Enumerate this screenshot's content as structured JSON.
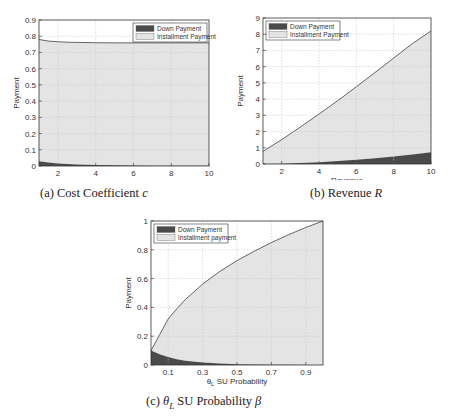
{
  "chart_data": [
    {
      "id": "a",
      "type": "area",
      "stacked": true,
      "title": "",
      "caption": "(a) Cost Coefficient c",
      "caption_parts": {
        "prefix": "(a) Cost Coefficient ",
        "var": "c"
      },
      "xlabel": "Cost Coefficient",
      "ylabel": "Payment",
      "xlim": [
        1,
        10
      ],
      "ylim": [
        0,
        0.9
      ],
      "xticks": [
        2,
        4,
        6,
        8,
        10
      ],
      "xtick_labels": [
        "2",
        "4",
        "6",
        "8",
        "10"
      ],
      "yticks": [
        0,
        0.1,
        0.2,
        0.3,
        0.4,
        0.5,
        0.6,
        0.7,
        0.8,
        0.9
      ],
      "ytick_labels": [
        "0",
        "0.1",
        "0.2",
        "0.3",
        "0.4",
        "0.5",
        "0.6",
        "0.7",
        "0.8",
        "0.9"
      ],
      "grid": true,
      "legend_position": "upper right",
      "x": [
        1,
        1.5,
        2,
        2.5,
        3,
        4,
        5,
        6,
        7,
        8,
        9,
        10
      ],
      "series": [
        {
          "name": "Down Payment",
          "values": [
            0.03,
            0.022,
            0.016,
            0.012,
            0.009,
            0.006,
            0.004,
            0.003,
            0.002,
            0.002,
            0.001,
            0.001
          ]
        },
        {
          "name": "Installment Payment",
          "values": [
            0.75,
            0.748,
            0.75,
            0.751,
            0.753,
            0.754,
            0.755,
            0.756,
            0.757,
            0.757,
            0.758,
            0.758
          ]
        }
      ],
      "total": [
        0.78,
        0.77,
        0.766,
        0.763,
        0.762,
        0.76,
        0.759,
        0.759,
        0.759,
        0.759,
        0.759,
        0.759
      ]
    },
    {
      "id": "b",
      "type": "area",
      "stacked": true,
      "title": "",
      "caption": "(b) Revenue R",
      "caption_parts": {
        "prefix": "(b) Revenue ",
        "var": "R"
      },
      "xlabel": "Revenue",
      "ylabel": "Payment",
      "xlim": [
        1,
        10
      ],
      "ylim": [
        0,
        9
      ],
      "xticks": [
        2,
        4,
        6,
        8,
        10
      ],
      "xtick_labels": [
        "2",
        "4",
        "6",
        "8",
        "10"
      ],
      "yticks": [
        0,
        1,
        2,
        3,
        4,
        5,
        6,
        7,
        8,
        9
      ],
      "ytick_labels": [
        "0",
        "1",
        "2",
        "3",
        "4",
        "5",
        "6",
        "7",
        "8",
        "9"
      ],
      "grid": true,
      "legend_position": "upper left",
      "x": [
        1,
        2,
        3,
        4,
        5,
        6,
        7,
        8,
        9,
        10
      ],
      "series": [
        {
          "name": "Down Payment",
          "values": [
            0.0,
            0.02,
            0.06,
            0.11,
            0.18,
            0.26,
            0.36,
            0.47,
            0.59,
            0.72
          ]
        },
        {
          "name": "Installment Payment",
          "values": [
            0.78,
            1.48,
            2.22,
            2.97,
            3.72,
            4.5,
            5.28,
            6.06,
            6.83,
            7.48
          ]
        }
      ],
      "total": [
        0.78,
        1.5,
        2.28,
        3.08,
        3.9,
        4.76,
        5.64,
        6.53,
        7.42,
        8.2
      ]
    },
    {
      "id": "c",
      "type": "area",
      "stacked": true,
      "title": "",
      "caption": "(c) θL SU Probability β",
      "caption_parts": {
        "prefix": "(c) ",
        "theta": "θ",
        "sub": "L",
        "mid": " SU Probability ",
        "var": "β"
      },
      "xlabel": "θL SU Probability",
      "xlabel_parts": {
        "theta": "θ",
        "sub": "L",
        "rest": " SU Probability"
      },
      "ylabel": "Payment",
      "xlim": [
        0,
        1
      ],
      "ylim": [
        0,
        1
      ],
      "xticks": [
        0.1,
        0.3,
        0.5,
        0.7,
        0.9
      ],
      "xtick_labels": [
        "0.1",
        "0.3",
        "0.5",
        "0.7",
        "0.9"
      ],
      "yticks": [
        0,
        0.2,
        0.4,
        0.6,
        0.8,
        1
      ],
      "ytick_labels": [
        "0",
        "0.2",
        "0.4",
        "0.6",
        "0.8",
        "1"
      ],
      "grid": true,
      "legend_position": "upper left",
      "x": [
        0,
        0.05,
        0.1,
        0.15,
        0.2,
        0.3,
        0.4,
        0.5,
        0.6,
        0.7,
        0.8,
        0.9,
        1.0
      ],
      "series": [
        {
          "name": "Down Payment",
          "values": [
            0.1,
            0.075,
            0.055,
            0.04,
            0.03,
            0.017,
            0.01,
            0.006,
            0.004,
            0.002,
            0.001,
            0.0005,
            0.0
          ]
        },
        {
          "name": "Installment payment",
          "values": [
            0.0,
            0.135,
            0.265,
            0.35,
            0.425,
            0.545,
            0.64,
            0.719,
            0.786,
            0.848,
            0.904,
            0.954,
            1.0
          ]
        }
      ],
      "total": [
        0.1,
        0.21,
        0.32,
        0.39,
        0.455,
        0.562,
        0.65,
        0.725,
        0.79,
        0.85,
        0.905,
        0.955,
        1.0
      ]
    }
  ],
  "colors": {
    "down_payment_fill": "#4a4a4a",
    "installment_fill": "#e4e4e4",
    "line": "#555555",
    "axis": "#333333",
    "grid": "#c8c8c8",
    "text": "#333333"
  }
}
